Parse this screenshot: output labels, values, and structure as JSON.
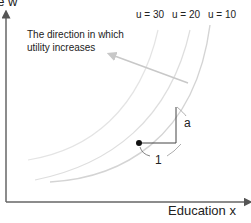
{
  "diagram": {
    "y_axis_label": "ge w",
    "x_axis_label": "Education x",
    "annotation": "The direction in which utility increases",
    "curves": [
      {
        "label": "u = 30",
        "utility": 30
      },
      {
        "label": "u = 20",
        "utility": 20
      },
      {
        "label": "u = 10",
        "utility": 10
      }
    ],
    "triangle_labels": {
      "run": "1",
      "rise": "a"
    },
    "colors": {
      "axis": "#555555",
      "curve": "#d0d0d0",
      "arrow": "#c8c8c8",
      "triangle": "#444444",
      "point": "#111111"
    }
  }
}
